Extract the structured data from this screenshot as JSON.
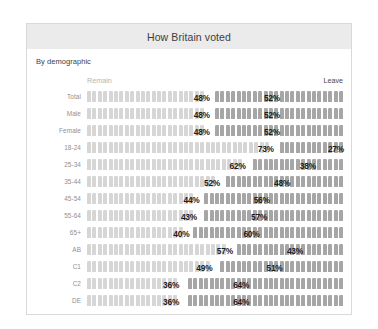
{
  "card": {
    "title": "How Britain voted",
    "subtitle": "By demographic",
    "series_left_label": "Remain",
    "series_right_label": "Leave"
  },
  "chart_data": {
    "type": "bar",
    "subtype": "pictogram-stacked-bar",
    "title": "How Britain voted",
    "subtitle": "By demographic",
    "xlabel": "",
    "ylabel": "",
    "xlim": [
      0,
      100
    ],
    "unit": "%",
    "grid": false,
    "legend_position": "top",
    "orientation": "horizontal",
    "stacked": true,
    "icon": "person-icon",
    "colors": {
      "remain": "#d6d6d6",
      "leave": "#a6a6a6",
      "value_text": "#1c1c1c",
      "title_band": "#ebebeb",
      "card_border": "#d9d9d9"
    },
    "categories": [
      "Total",
      "Male",
      "Female",
      "18-24",
      "25-34",
      "35-44",
      "45-54",
      "55-64",
      "65+",
      "AB",
      "C1",
      "C2",
      "DE"
    ],
    "series": [
      {
        "name": "Remain",
        "values": [
          48,
          48,
          48,
          73,
          62,
          52,
          44,
          43,
          40,
          57,
          49,
          36,
          36
        ]
      },
      {
        "name": "Leave",
        "values": [
          52,
          52,
          52,
          27,
          38,
          48,
          56,
          57,
          60,
          43,
          51,
          64,
          64
        ]
      }
    ],
    "rows": [
      {
        "label": "Total",
        "remain": 48,
        "leave": 52,
        "remain_text": "48%",
        "leave_text": "52%"
      },
      {
        "label": "Male",
        "remain": 48,
        "leave": 52,
        "remain_text": "48%",
        "leave_text": "52%"
      },
      {
        "label": "Female",
        "remain": 48,
        "leave": 52,
        "remain_text": "48%",
        "leave_text": "52%"
      },
      {
        "label": "18-24",
        "remain": 73,
        "leave": 27,
        "remain_text": "73%",
        "leave_text": "27%"
      },
      {
        "label": "25-34",
        "remain": 62,
        "leave": 38,
        "remain_text": "62%",
        "leave_text": "38%"
      },
      {
        "label": "35-44",
        "remain": 52,
        "leave": 48,
        "remain_text": "52%",
        "leave_text": "48%"
      },
      {
        "label": "45-54",
        "remain": 44,
        "leave": 56,
        "remain_text": "44%",
        "leave_text": "56%"
      },
      {
        "label": "55-64",
        "remain": 43,
        "leave": 57,
        "remain_text": "43%",
        "leave_text": "57%"
      },
      {
        "label": "65+",
        "remain": 40,
        "leave": 60,
        "remain_text": "40%",
        "leave_text": "60%"
      },
      {
        "label": "AB",
        "remain": 57,
        "leave": 43,
        "remain_text": "57%",
        "leave_text": "43%"
      },
      {
        "label": "C1",
        "remain": 49,
        "leave": 51,
        "remain_text": "49%",
        "leave_text": "51%"
      },
      {
        "label": "C2",
        "remain": 36,
        "leave": 64,
        "remain_text": "36%",
        "leave_text": "64%"
      },
      {
        "label": "DE",
        "remain": 36,
        "leave": 64,
        "remain_text": "36%",
        "leave_text": "64%"
      }
    ]
  }
}
